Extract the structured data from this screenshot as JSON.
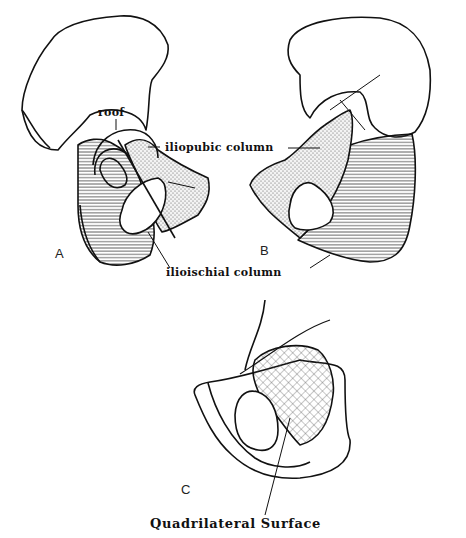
{
  "figure": {
    "panels": [
      {
        "id": "A",
        "label": "A"
      },
      {
        "id": "B",
        "label": "B"
      },
      {
        "id": "C",
        "label": "C"
      }
    ],
    "labels": {
      "roof": "roof",
      "iliopubic_column": "iliopubic column",
      "ilioischial_column": "ilioischial column"
    },
    "caption": "Quadrilateral Surface",
    "colors": {
      "line": "#111111",
      "background": "#ffffff",
      "stipple": "#555555",
      "hatch": "#333333"
    }
  }
}
